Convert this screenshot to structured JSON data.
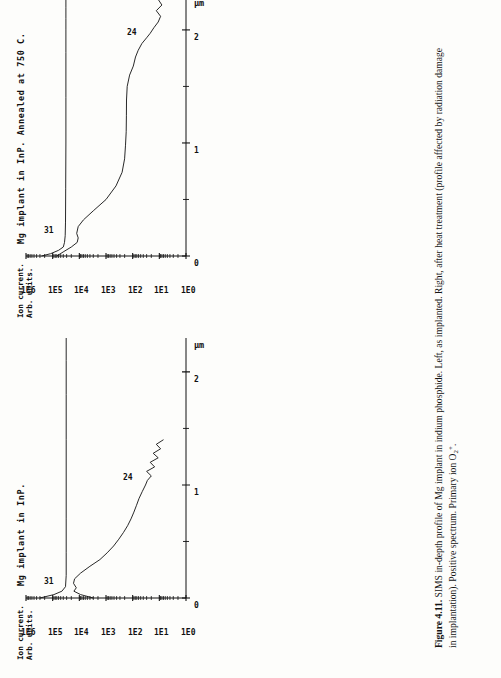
{
  "figure": {
    "caption_label": "Figure 4.11.",
    "caption_text": " SIMS in-depth profile of Mg implant in indium phosphide. Left, as implanted. Right, after heat treatment (profile affected by radiation damage in implantation). Positive spectrum. Primary ion O",
    "caption_sub": "2",
    "caption_sup": "+",
    "caption_end": "."
  },
  "chart_data": [
    {
      "id": "annealed",
      "type": "line",
      "title": "Mg implant in InP. Annealed at 750 C.",
      "ylabel_line1": "Ion current.",
      "ylabel_line2": "Arb. units.",
      "xlabel": "µm",
      "xticks": [
        0,
        1,
        2
      ],
      "xticklabels": [
        "0",
        "1",
        "2"
      ],
      "xlim": [
        0,
        2.3
      ],
      "yticklabels": [
        "1E6",
        "1E5",
        "1E4",
        "1E3",
        "1E2",
        "1E1",
        "1E0"
      ],
      "ylim": [
        1,
        1000000
      ],
      "grid": false,
      "legend": "none",
      "series": [
        {
          "name": "31",
          "annotation": "31",
          "x": [
            0.0,
            0.02,
            0.05,
            0.08,
            0.12,
            0.18,
            0.3,
            0.6,
            1.0,
            1.4,
            1.8,
            2.0,
            2.1,
            2.2,
            2.3
          ],
          "y": [
            260000,
            120000,
            60000,
            40000,
            36000,
            34000,
            33000,
            32500,
            32000,
            32000,
            32000,
            32000,
            32000,
            32000,
            32000
          ]
        },
        {
          "name": "24",
          "annotation": "24",
          "x": [
            0.0,
            0.04,
            0.08,
            0.12,
            0.16,
            0.2,
            0.26,
            0.32,
            0.4,
            0.5,
            0.62,
            0.74,
            0.86,
            0.98,
            1.1,
            1.24,
            1.38,
            1.5,
            1.6,
            1.68,
            1.76,
            1.82,
            1.88,
            1.93,
            1.97,
            2.02,
            2.07,
            2.12,
            2.17,
            2.22,
            2.27
          ],
          "y": [
            70000,
            38000,
            20000,
            12000,
            11000,
            12500,
            11000,
            7000,
            3000,
            1000,
            420,
            250,
            200,
            185,
            175,
            172,
            170,
            160,
            130,
            95,
            78,
            62,
            45,
            30,
            22,
            16,
            11,
            9,
            13,
            8,
            11
          ]
        }
      ]
    },
    {
      "id": "as-implanted",
      "type": "line",
      "title": "Mg implant in InP.",
      "ylabel_line1": "Ion current.",
      "ylabel_line2": "Arb. units.",
      "xlabel": "µm",
      "xticks": [
        0,
        1,
        2
      ],
      "xticklabels": [
        "0",
        "1",
        "2"
      ],
      "xlim": [
        0,
        2.3
      ],
      "yticklabels": [
        "1E6",
        "1E5",
        "1E4",
        "1E3",
        "1E2",
        "1E1",
        "1E0"
      ],
      "ylim": [
        1,
        1000000
      ],
      "grid": false,
      "legend": "none",
      "series": [
        {
          "name": "31",
          "annotation": "31",
          "x": [
            0.0,
            0.03,
            0.06,
            0.1,
            0.2,
            0.4,
            0.7,
            1.0,
            1.4,
            1.8,
            2.1,
            2.3
          ],
          "y": [
            300000,
            90000,
            45000,
            33000,
            31000,
            31000,
            31000,
            31000,
            31000,
            31000,
            31000,
            31000
          ]
        },
        {
          "name": "24",
          "annotation": "24",
          "x": [
            0.0,
            0.03,
            0.06,
            0.09,
            0.13,
            0.17,
            0.22,
            0.28,
            0.34,
            0.4,
            0.46,
            0.52,
            0.58,
            0.64,
            0.7,
            0.76,
            0.82,
            0.88,
            0.94,
            1.0,
            1.04,
            1.08,
            1.12,
            1.16,
            1.2,
            1.24,
            1.28,
            1.32,
            1.36,
            1.4
          ],
          "y": [
            3000,
            9000,
            16000,
            13000,
            16500,
            15000,
            9000,
            4000,
            1700,
            900,
            520,
            330,
            220,
            155,
            115,
            90,
            72,
            58,
            44,
            33,
            28,
            20,
            30,
            15,
            22,
            11,
            17,
            9,
            13,
            7
          ]
        }
      ]
    }
  ]
}
